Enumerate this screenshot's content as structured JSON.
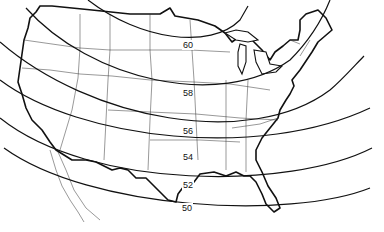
{
  "map": {
    "subject": "Conterminous United States with isolines",
    "colors": {
      "line": "#111111",
      "background": "#ffffff"
    },
    "isolines": [
      {
        "value": "60",
        "label_pos": {
          "x": 182,
          "y": 40
        }
      },
      {
        "value": "58",
        "label_pos": {
          "x": 182,
          "y": 88
        }
      },
      {
        "value": "56",
        "label_pos": {
          "x": 182,
          "y": 126
        }
      },
      {
        "value": "54",
        "label_pos": {
          "x": 182,
          "y": 152
        }
      },
      {
        "value": "52",
        "label_pos": {
          "x": 182,
          "y": 180
        }
      },
      {
        "value": "50",
        "label_pos": {
          "x": 181,
          "y": 203
        }
      }
    ]
  }
}
